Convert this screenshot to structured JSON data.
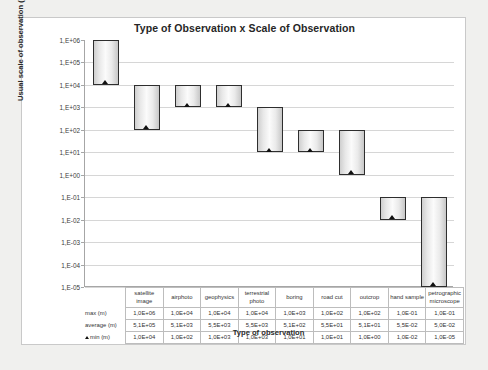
{
  "chart_data": {
    "type": "bar",
    "title": "Type of Observation x Scale of Observation",
    "xlabel": "Type of observation",
    "ylabel": "Usual scale of observation (m)",
    "yscale": "log",
    "ylim": [
      1e-05,
      1000000.0
    ],
    "grid": true,
    "legend": "none",
    "ytick_labels": [
      "1,E+06",
      "1,E+05",
      "1,E+04",
      "1,E+03",
      "1,E+02",
      "1,E+01",
      "1,E+00",
      "1,E-01",
      "1,E-02",
      "1,E-03",
      "1,E-04",
      "1,E-05"
    ],
    "ytick_values": [
      1000000,
      100000,
      10000,
      1000,
      100,
      10,
      1,
      0.1,
      0.01,
      0.001,
      0.0001,
      1e-05
    ],
    "categories": [
      "satellite image",
      "airphoto",
      "geophysics",
      "terrestrial photo",
      "boring",
      "road cut",
      "outcrop",
      "hand sample",
      "petrographic microscope"
    ],
    "series": [
      {
        "name": "max (m)",
        "labels": [
          "1,0E+06",
          "1,0E+04",
          "1,0E+04",
          "1,0E+04",
          "1,0E+03",
          "1,0E+02",
          "1,0E+02",
          "1,0E-01",
          "1,0E-01"
        ],
        "values": [
          1000000,
          10000,
          10000,
          10000,
          1000,
          100,
          100,
          0.1,
          0.1
        ]
      },
      {
        "name": "average (m)",
        "labels": [
          "5,1E+05",
          "5,1E+03",
          "5,5E+03",
          "5,5E+03",
          "5,1E+02",
          "5,5E+01",
          "5,1E+01",
          "5,5E-02",
          "5,0E-02"
        ],
        "values": [
          510000,
          5100,
          5500,
          5500,
          510,
          55,
          51,
          0.055,
          0.05
        ]
      },
      {
        "name": "min (m)",
        "labels": [
          "1,0E+04",
          "1,0E+02",
          "1,0E+03",
          "1,0E+03",
          "1,0E+01",
          "1,0E+01",
          "1,0E+00",
          "1,0E-02",
          "1,0E-05"
        ],
        "values": [
          10000,
          100,
          1000,
          1000,
          10,
          10,
          1,
          0.01,
          1e-05
        ]
      }
    ]
  },
  "table": {
    "corner_label": "",
    "row_labels": [
      "max (m)",
      "average (m)",
      "min (m)"
    ],
    "min_row_has_marker": true
  },
  "colors": {
    "page_bg": "#f0f0ee",
    "card_bg": "#ffffff",
    "bar_border": "#2e2e2e",
    "gridline": "#d6d6d6",
    "axis": "#a6a6a6",
    "marker": "#111111",
    "text": "#262626"
  }
}
